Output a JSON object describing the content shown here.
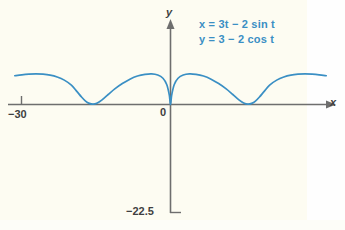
{
  "figure": {
    "background_color": "#fdfcf2",
    "curve_color": "#3a8fc4",
    "axis_color": "#6e6e6e",
    "text_color": "#3f3f3f"
  },
  "annotations": {
    "equation_x": "x = 3t − 2 sin t",
    "equation_y": "y = 3 − 2 cos t"
  },
  "axes": {
    "x_axis_label": "x",
    "y_axis_label": "y",
    "origin_label": "0",
    "x_tick_label": "−30",
    "y_tick_label": "−22.5"
  },
  "chart_data": {
    "type": "line",
    "title": "",
    "xlabel": "x",
    "ylabel": "y",
    "grid": false,
    "legend": "none",
    "annotations": [
      "x = 3t − 2 sin t",
      "y = 3 − 2 cos t"
    ],
    "parametric": {
      "x_expression": "3t - 2 sin t",
      "y_expression": "3 - 2 cos t",
      "t_min": -12.566,
      "t_max": 12.566
    },
    "xlim": [
      -33.0,
      33.0
    ],
    "ylim": [
      -22.5,
      9.0
    ],
    "x_ticks": [
      -30,
      0
    ],
    "x_tick_labels": [
      "−30",
      "0"
    ],
    "y_ticks": [
      -22.5
    ],
    "y_tick_labels": [
      "−22.5"
    ],
    "series": [
      {
        "name": "prolate cycloid",
        "color": "#3a8fc4",
        "x": [
          -33.0,
          -31.5,
          -30.0,
          -28.5,
          -27.0,
          -25.5,
          -24.0,
          -22.5,
          -21.0,
          -19.85,
          -18.85,
          -18.0,
          -17.2,
          -16.4,
          -15.5,
          -14.5,
          -13.2,
          -11.8,
          -10.2,
          -8.6,
          -7.0,
          -5.4,
          -4.0,
          -2.7,
          -1.6,
          -0.8,
          -0.25,
          0.0,
          0.25,
          0.8,
          1.6,
          2.7,
          4.0,
          5.4,
          7.0,
          8.6,
          10.2,
          11.8,
          13.2,
          14.5,
          15.5,
          16.4,
          17.2,
          18.0,
          18.85,
          19.85,
          21.0,
          22.5,
          24.0,
          25.5,
          27.0,
          28.5,
          30.0,
          31.5,
          33.0
        ],
        "y": [
          4.6,
          4.75,
          4.85,
          4.9,
          4.85,
          4.7,
          4.4,
          3.9,
          3.1,
          2.1,
          1.2,
          0.55,
          0.18,
          0.05,
          0.25,
          0.75,
          1.6,
          2.5,
          3.35,
          4.05,
          4.55,
          4.82,
          4.9,
          4.72,
          4.2,
          3.2,
          1.5,
          0.0,
          1.5,
          3.2,
          4.2,
          4.72,
          4.9,
          4.82,
          4.55,
          4.05,
          3.35,
          2.5,
          1.6,
          0.75,
          0.25,
          0.05,
          0.18,
          0.55,
          1.2,
          2.1,
          3.1,
          3.9,
          4.4,
          4.7,
          4.85,
          4.9,
          4.85,
          4.75,
          4.6
        ]
      }
    ]
  }
}
